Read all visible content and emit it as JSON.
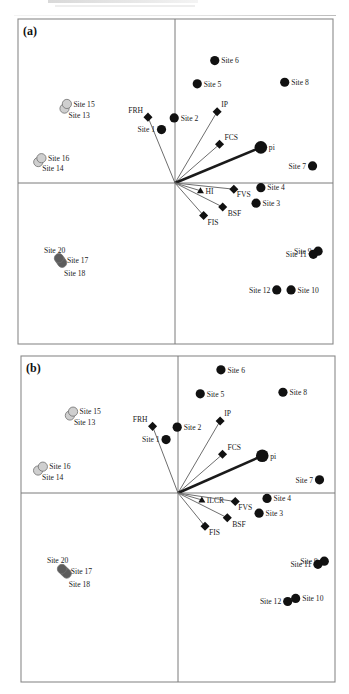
{
  "figure": {
    "header_text_cropped": "",
    "colors": {
      "frame": "#8a8a8a",
      "axis": "#7a7a7a",
      "vector": "#6e6e6e",
      "pi_vector": "#1a1a1a",
      "site_group_black": "#111111",
      "site_group_light_grey": "#cfcfcf",
      "site_group_dark_grey": "#5c5c5c",
      "variable_marker": "#111111"
    }
  },
  "chart_data": [
    {
      "panel_label": "(a)",
      "type": "scatter",
      "title": "",
      "xlabel": "",
      "ylabel": "",
      "grid": false,
      "axes": "centered cross through origin",
      "xlim": [
        -10,
        10
      ],
      "ylim": [
        -10,
        10
      ],
      "sites": [
        {
          "label": "Site 1",
          "x": -0.85,
          "y": 3.45,
          "group": "black",
          "label_side": "left"
        },
        {
          "label": "Site 2",
          "x": -0.05,
          "y": 4.2,
          "group": "black",
          "label_side": "right"
        },
        {
          "label": "Site 3",
          "x": 5.1,
          "y": -1.3,
          "group": "black",
          "label_side": "right"
        },
        {
          "label": "Site 4",
          "x": 5.4,
          "y": -0.3,
          "group": "black",
          "label_side": "right"
        },
        {
          "label": "Site 5",
          "x": 1.4,
          "y": 6.4,
          "group": "black",
          "label_side": "right"
        },
        {
          "label": "Site 6",
          "x": 2.5,
          "y": 7.9,
          "group": "black",
          "label_side": "right"
        },
        {
          "label": "Site 7",
          "x": 8.65,
          "y": 1.1,
          "group": "black",
          "label_side": "left"
        },
        {
          "label": "Site 8",
          "x": 6.9,
          "y": 6.5,
          "group": "black",
          "label_side": "right"
        },
        {
          "label": "Site 9",
          "x": 9.0,
          "y": -4.4,
          "group": "black",
          "label_side": "left"
        },
        {
          "label": "Site 10",
          "x": 7.3,
          "y": -6.9,
          "group": "black",
          "label_side": "right"
        },
        {
          "label": "Site 11",
          "x": 8.7,
          "y": -4.6,
          "group": "black",
          "label_side": "left"
        },
        {
          "label": "Site 12",
          "x": 6.4,
          "y": -6.9,
          "group": "black",
          "label_side": "left"
        },
        {
          "label": "Site 13",
          "x": -6.95,
          "y": 4.8,
          "group": "light_grey",
          "label_side": "right-below"
        },
        {
          "label": "Site 14",
          "x": -8.6,
          "y": 1.35,
          "group": "light_grey",
          "label_side": "right-below"
        },
        {
          "label": "Site 15",
          "x": -6.8,
          "y": 5.1,
          "group": "light_grey",
          "label_side": "right"
        },
        {
          "label": "Site 16",
          "x": -8.4,
          "y": 1.6,
          "group": "light_grey",
          "label_side": "right"
        },
        {
          "label": "Site 17",
          "x": -7.2,
          "y": -5.0,
          "group": "dark_grey",
          "label_side": "right"
        },
        {
          "label": "Site 18",
          "x": -7.1,
          "y": -5.15,
          "group": "dark_grey",
          "label_side": "below"
        },
        {
          "label": "Site 20",
          "x": -7.3,
          "y": -4.85,
          "group": "dark_grey",
          "label_side": "above"
        }
      ],
      "vectors": [
        {
          "label": "FRH",
          "x": -1.7,
          "y": 4.25,
          "marker": "diamond"
        },
        {
          "label": "IP",
          "x": 2.65,
          "y": 4.6,
          "marker": "diamond"
        },
        {
          "label": "FCS",
          "x": 2.8,
          "y": 2.5,
          "marker": "diamond"
        },
        {
          "label": "pi",
          "x": 5.4,
          "y": 2.3,
          "marker": "large-circle",
          "bold": true
        },
        {
          "label": "HI",
          "x": 1.6,
          "y": -0.5,
          "marker": "triangle"
        },
        {
          "label": "FVS",
          "x": 3.7,
          "y": -0.4,
          "marker": "diamond"
        },
        {
          "label": "BSF",
          "x": 3.0,
          "y": -1.55,
          "marker": "diamond"
        },
        {
          "label": "FIS",
          "x": 1.8,
          "y": -2.1,
          "marker": "diamond"
        }
      ]
    },
    {
      "panel_label": "(b)",
      "type": "scatter",
      "title": "",
      "xlabel": "",
      "ylabel": "",
      "grid": false,
      "axes": "centered cross through origin",
      "xlim": [
        -10,
        10
      ],
      "ylim": [
        -10,
        10
      ],
      "sites": [
        {
          "label": "Site 1",
          "x": -0.75,
          "y": 3.45,
          "group": "black",
          "label_side": "left"
        },
        {
          "label": "Site 2",
          "x": -0.05,
          "y": 4.25,
          "group": "black",
          "label_side": "right"
        },
        {
          "label": "Site 3",
          "x": 5.1,
          "y": -1.3,
          "group": "black",
          "label_side": "right"
        },
        {
          "label": "Site 4",
          "x": 5.6,
          "y": -0.35,
          "group": "black",
          "label_side": "right"
        },
        {
          "label": "Site 5",
          "x": 1.4,
          "y": 6.4,
          "group": "black",
          "label_side": "right"
        },
        {
          "label": "Site 6",
          "x": 2.7,
          "y": 7.95,
          "group": "black",
          "label_side": "right"
        },
        {
          "label": "Site 7",
          "x": 8.9,
          "y": 0.85,
          "group": "black",
          "label_side": "left"
        },
        {
          "label": "Site 8",
          "x": 6.6,
          "y": 6.5,
          "group": "black",
          "label_side": "right"
        },
        {
          "label": "Site 9",
          "x": 9.2,
          "y": -4.4,
          "group": "black",
          "label_side": "left"
        },
        {
          "label": "Site 10",
          "x": 7.4,
          "y": -6.8,
          "group": "black",
          "label_side": "right"
        },
        {
          "label": "Site 11",
          "x": 8.8,
          "y": -4.6,
          "group": "black",
          "label_side": "left"
        },
        {
          "label": "Site 12",
          "x": 6.9,
          "y": -7.0,
          "group": "black",
          "label_side": "left"
        },
        {
          "label": "Site 13",
          "x": -6.8,
          "y": 5.0,
          "group": "light_grey",
          "label_side": "right-below"
        },
        {
          "label": "Site 14",
          "x": -8.8,
          "y": 1.45,
          "group": "light_grey",
          "label_side": "right-below"
        },
        {
          "label": "Site 15",
          "x": -6.6,
          "y": 5.25,
          "group": "light_grey",
          "label_side": "right"
        },
        {
          "label": "Site 16",
          "x": -8.5,
          "y": 1.7,
          "group": "light_grey",
          "label_side": "right"
        },
        {
          "label": "Site 17",
          "x": -7.15,
          "y": -5.05,
          "group": "dark_grey",
          "label_side": "right"
        },
        {
          "label": "Site 18",
          "x": -7.0,
          "y": -5.2,
          "group": "dark_grey",
          "label_side": "below"
        },
        {
          "label": "Site 20",
          "x": -7.3,
          "y": -4.9,
          "group": "dark_grey",
          "label_side": "above"
        }
      ],
      "vectors": [
        {
          "label": "FRH",
          "x": -1.6,
          "y": 4.3,
          "marker": "diamond"
        },
        {
          "label": "IP",
          "x": 2.65,
          "y": 4.65,
          "marker": "diamond"
        },
        {
          "label": "FCS",
          "x": 2.8,
          "y": 2.5,
          "marker": "diamond"
        },
        {
          "label": "pi",
          "x": 5.3,
          "y": 2.4,
          "marker": "large-circle",
          "bold": true
        },
        {
          "label": "ILCR",
          "x": 1.5,
          "y": -0.45,
          "marker": "triangle"
        },
        {
          "label": "FVS",
          "x": 3.6,
          "y": -0.55,
          "marker": "diamond"
        },
        {
          "label": "BSF",
          "x": 3.1,
          "y": -1.6,
          "marker": "diamond"
        },
        {
          "label": "FIS",
          "x": 1.7,
          "y": -2.15,
          "marker": "diamond"
        }
      ]
    }
  ]
}
